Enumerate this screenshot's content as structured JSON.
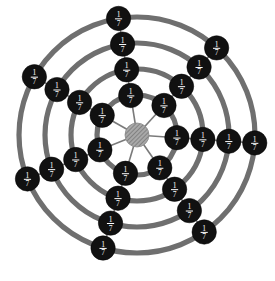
{
  "figure": {
    "name": "web-graph-fraction-labels",
    "type": "radial-web-graph",
    "background_color": "#ffffff",
    "width": 275,
    "height": 281
  },
  "geometry": {
    "center": {
      "x": 137,
      "y": 135
    },
    "hub_radius": 12,
    "node_radius": 12.2,
    "ring_radii": [
      40,
      66,
      92,
      118
    ],
    "spoke_count": 7,
    "ring_count": 4,
    "start_angle_deg": -99,
    "angle_step_deg": 51.43
  },
  "style": {
    "ring_color": "#6f6f6f",
    "ring_stroke_width": 5.2,
    "spoke_color": "#7a7a7a",
    "spoke_stroke_width": 1.6,
    "node_fill": "#111111",
    "node_text_color": "#ffffff",
    "hub_fill": "#9a9a9a",
    "hub_hatch_color": "#707070"
  },
  "labels": {
    "node_value": "1/7",
    "numerator": "1",
    "denominator": "7"
  },
  "nodes": [
    {
      "id": "n-r1-s1",
      "ring": 1,
      "spoke": 1,
      "label": "1/7",
      "numerator": "1",
      "denominator": "7"
    },
    {
      "id": "n-r1-s2",
      "ring": 1,
      "spoke": 2,
      "label": "1/7",
      "numerator": "1",
      "denominator": "7"
    },
    {
      "id": "n-r1-s3",
      "ring": 1,
      "spoke": 3,
      "label": "1/7",
      "numerator": "1",
      "denominator": "7"
    },
    {
      "id": "n-r1-s4",
      "ring": 1,
      "spoke": 4,
      "label": "1/7",
      "numerator": "1",
      "denominator": "7"
    },
    {
      "id": "n-r1-s5",
      "ring": 1,
      "spoke": 5,
      "label": "1/7",
      "numerator": "1",
      "denominator": "7"
    },
    {
      "id": "n-r1-s6",
      "ring": 1,
      "spoke": 6,
      "label": "1/7",
      "numerator": "1",
      "denominator": "7"
    },
    {
      "id": "n-r1-s7",
      "ring": 1,
      "spoke": 7,
      "label": "1/7",
      "numerator": "1",
      "denominator": "7"
    },
    {
      "id": "n-r2-s1",
      "ring": 2,
      "spoke": 1,
      "label": "1/7",
      "numerator": "1",
      "denominator": "7"
    },
    {
      "id": "n-r2-s2",
      "ring": 2,
      "spoke": 2,
      "label": "1/7",
      "numerator": "1",
      "denominator": "7"
    },
    {
      "id": "n-r2-s3",
      "ring": 2,
      "spoke": 3,
      "label": "1/7",
      "numerator": "1",
      "denominator": "7"
    },
    {
      "id": "n-r2-s4",
      "ring": 2,
      "spoke": 4,
      "label": "1/7",
      "numerator": "1",
      "denominator": "7"
    },
    {
      "id": "n-r2-s5",
      "ring": 2,
      "spoke": 5,
      "label": "1/7",
      "numerator": "1",
      "denominator": "7"
    },
    {
      "id": "n-r2-s6",
      "ring": 2,
      "spoke": 6,
      "label": "1/7",
      "numerator": "1",
      "denominator": "7"
    },
    {
      "id": "n-r2-s7",
      "ring": 2,
      "spoke": 7,
      "label": "1/7",
      "numerator": "1",
      "denominator": "7"
    },
    {
      "id": "n-r3-s1",
      "ring": 3,
      "spoke": 1,
      "label": "1/7",
      "numerator": "1",
      "denominator": "7"
    },
    {
      "id": "n-r3-s2",
      "ring": 3,
      "spoke": 2,
      "label": "1/7",
      "numerator": "1",
      "denominator": "7"
    },
    {
      "id": "n-r3-s3",
      "ring": 3,
      "spoke": 3,
      "label": "1/7",
      "numerator": "1",
      "denominator": "7"
    },
    {
      "id": "n-r3-s4",
      "ring": 3,
      "spoke": 4,
      "label": "1/7",
      "numerator": "1",
      "denominator": "7"
    },
    {
      "id": "n-r3-s5",
      "ring": 3,
      "spoke": 5,
      "label": "1/7",
      "numerator": "1",
      "denominator": "7"
    },
    {
      "id": "n-r3-s6",
      "ring": 3,
      "spoke": 6,
      "label": "1/7",
      "numerator": "1",
      "denominator": "7"
    },
    {
      "id": "n-r3-s7",
      "ring": 3,
      "spoke": 7,
      "label": "1/7",
      "numerator": "1",
      "denominator": "7"
    },
    {
      "id": "n-r4-s1",
      "ring": 4,
      "spoke": 1,
      "label": "1/7",
      "numerator": "1",
      "denominator": "7"
    },
    {
      "id": "n-r4-s2",
      "ring": 4,
      "spoke": 2,
      "label": "1/7",
      "numerator": "1",
      "denominator": "7"
    },
    {
      "id": "n-r4-s3",
      "ring": 4,
      "spoke": 3,
      "label": "1/7",
      "numerator": "1",
      "denominator": "7"
    },
    {
      "id": "n-r4-s4",
      "ring": 4,
      "spoke": 4,
      "label": "1/7",
      "numerator": "1",
      "denominator": "7"
    },
    {
      "id": "n-r4-s5",
      "ring": 4,
      "spoke": 5,
      "label": "1/7",
      "numerator": "1",
      "denominator": "7"
    },
    {
      "id": "n-r4-s6",
      "ring": 4,
      "spoke": 6,
      "label": "1/7",
      "numerator": "1",
      "denominator": "7"
    },
    {
      "id": "n-r4-s7",
      "ring": 4,
      "spoke": 7,
      "label": "1/7",
      "numerator": "1",
      "denominator": "7"
    }
  ]
}
